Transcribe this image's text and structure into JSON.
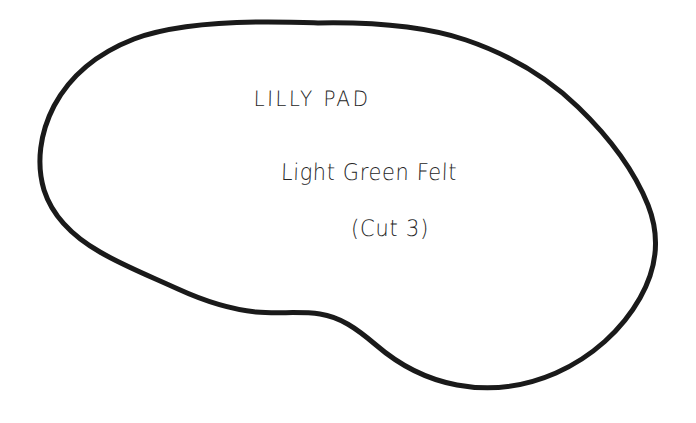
{
  "document": {
    "type": "sewing-pattern-template",
    "background_color": "#ffffff",
    "ink_color": "#1a1a1a",
    "text_color": "#262626"
  },
  "pattern": {
    "piece_name": "LILLY PAD",
    "material": "Light Green Felt",
    "quantity_note": "(Cut 3)",
    "outline": {
      "shape": "kidney-bean",
      "stroke_color": "#1a1a1a",
      "stroke_width": 5,
      "fill": "none",
      "path": "M 318 23 C 400 23 470 32 520 58 C 575 86 620 130 645 180 C 664 218 658 258 636 300 C 612 345 565 378 500 387 C 448 394 402 380 372 357 C 345 336 330 322 305 318 C 272 313 232 317 196 300 C 160 283 136 274 110 265 C 78 253 52 235 42 205 C 31 172 38 136 55 105 C 78 64 130 38 190 29 C 232 23 278 23 318 23 Z"
    },
    "extents": {
      "left_x": 38,
      "right_x": 658,
      "top_y": 22,
      "bottom_y": 388
    }
  },
  "labels": [
    {
      "id": "title",
      "text": "LILLY PAD",
      "center_x": 312,
      "baseline_y": 108
    },
    {
      "id": "material",
      "text": "Light Green Felt",
      "center_x": 369,
      "baseline_y": 182
    },
    {
      "id": "quantity",
      "text": "(Cut 3)",
      "center_x": 390,
      "baseline_y": 238
    }
  ]
}
